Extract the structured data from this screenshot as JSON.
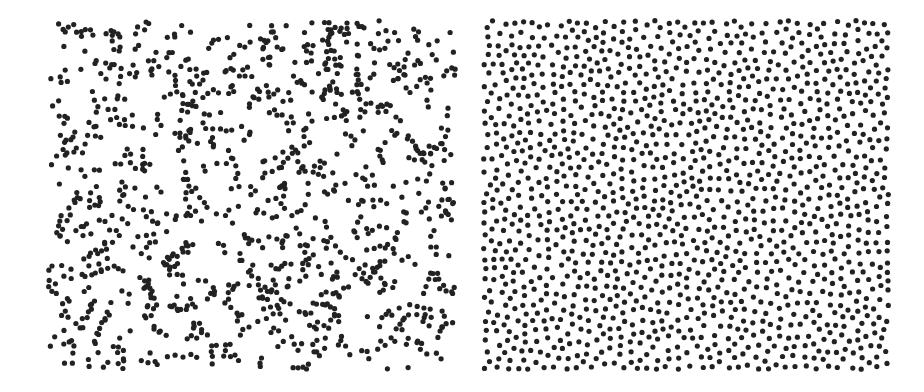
{
  "figure": {
    "background": "#ffffff",
    "dot_color": "#222222",
    "panels": [
      {
        "id": "left",
        "description": "clustered / random point pattern",
        "pattern": "clustered",
        "x": 45,
        "y": 17,
        "width": 414,
        "height": 356,
        "dot_radius": 2.6,
        "count": 1150,
        "seed": 17
      },
      {
        "id": "right",
        "description": "regular / evenly spaced point pattern",
        "pattern": "regular",
        "x": 480,
        "y": 17,
        "width": 412,
        "height": 356,
        "dot_radius": 2.6,
        "count": 1500,
        "min_spacing": 8.2,
        "seed": 42
      }
    ]
  }
}
